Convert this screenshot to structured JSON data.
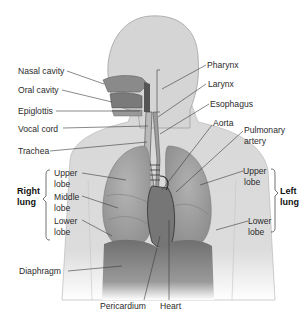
{
  "diagram": {
    "colors": {
      "body": "#d6d6d6",
      "body_outline": "#9a9a9a",
      "lung": "#a9a9a9",
      "lung_dark": "#8c8c8c",
      "diaphragm": "#7d7d7d",
      "heart": "#6e6e6e",
      "leader_line": "#3a3a3a"
    },
    "labels_left": [
      {
        "text": "Nasal cavity"
      },
      {
        "text": "Oral cavity"
      },
      {
        "text": "Epiglottis"
      },
      {
        "text": "Vocal cord"
      },
      {
        "text": "Trachea"
      }
    ],
    "labels_right": [
      {
        "text": "Pharynx"
      },
      {
        "text": "Larynx"
      },
      {
        "text": "Esophagus"
      },
      {
        "text": "Aorta"
      },
      {
        "text": "Pulmonary"
      },
      {
        "text": "artery"
      }
    ],
    "right_lung": {
      "group_label_1": "Right",
      "group_label_2": "lung",
      "upper_1": "Upper",
      "upper_2": "lobe",
      "middle_1": "Middle",
      "middle_2": "lobe",
      "lower_1": "Lower",
      "lower_2": "lobe"
    },
    "left_lung": {
      "group_label_1": "Left",
      "group_label_2": "lung",
      "upper_1": "Upper",
      "upper_2": "lobe",
      "lower_1": "Lower",
      "lower_2": "lobe"
    },
    "bottom_labels": {
      "diaphragm": "Diaphragm",
      "pericardium": "Pericardium",
      "heart": "Heart"
    }
  }
}
